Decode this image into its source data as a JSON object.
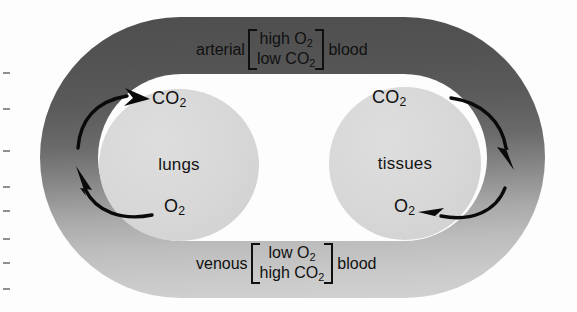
{
  "figure": {
    "colors": {
      "vessel_dark": "#4e4e4e",
      "vessel_light": "#d2d2d2",
      "organ_fill": "#d7d7d7",
      "background": "#fdfdfd",
      "ink": "#101010"
    }
  },
  "organs": {
    "lungs": {
      "label": "lungs"
    },
    "tissues": {
      "label": "tissues"
    }
  },
  "gas_labels": {
    "lungs_co2": "CO",
    "lungs_co2_sub": "2",
    "lungs_o2": "O",
    "lungs_o2_sub": "2",
    "tissues_co2": "CO",
    "tissues_co2_sub": "2",
    "tissues_o2": "O",
    "tissues_o2_sub": "2"
  },
  "blood_notes": {
    "arterial": {
      "prefix": "arterial",
      "line1_text": "high O",
      "line1_sub": "2",
      "line2_text": "low CO",
      "line2_sub": "2",
      "suffix": "blood"
    },
    "venous": {
      "prefix": "venous",
      "line1_text": "low O",
      "line1_sub": "2",
      "line2_text": "high CO",
      "line2_sub": "2",
      "suffix": "blood"
    }
  },
  "flow_arrows": [
    {
      "id": "lungs-co2-in",
      "description": "blood releases CO2 at the lungs",
      "direction": "up-right"
    },
    {
      "id": "lungs-o2-out",
      "description": "O2 leaves the lungs into blood",
      "direction": "up-left"
    },
    {
      "id": "tissues-co2-out",
      "description": "CO2 leaves tissues into blood",
      "direction": "down-right"
    },
    {
      "id": "tissues-o2-in",
      "description": "O2 delivered into tissues",
      "direction": "left"
    }
  ],
  "margin_ticks": [
    72,
    108,
    150,
    186,
    210,
    238,
    262,
    288
  ]
}
